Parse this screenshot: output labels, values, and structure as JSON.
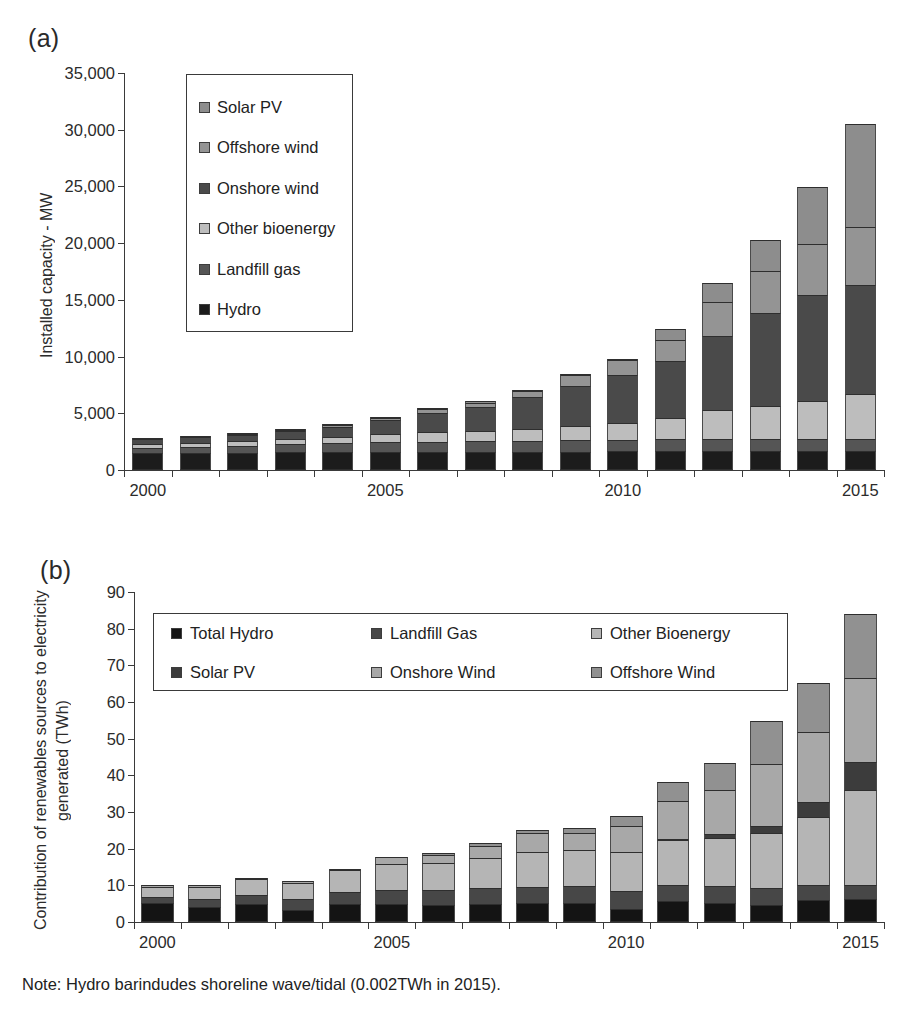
{
  "figure": {
    "note": "Note: Hydro barindudes shoreline wave/tidal (0.002TWh in 2015)."
  },
  "panel_a": {
    "label": "(a)",
    "legend_items": [
      {
        "label": "Solar PV",
        "color": "#8d8d8d"
      },
      {
        "label": "Offshore wind",
        "color": "#949494"
      },
      {
        "label": "Onshore wind",
        "color": "#4a4a4a"
      },
      {
        "label": "Other bioenergy",
        "color": "#bdbdbd"
      },
      {
        "label": "Landfill gas",
        "color": "#555555"
      },
      {
        "label": "Hydro",
        "color": "#1c1c1c"
      }
    ]
  },
  "panel_b": {
    "label": "(b)",
    "legend_items": [
      {
        "label": "Total Hydro",
        "color": "#141414"
      },
      {
        "label": "Landfill Gas",
        "color": "#474747"
      },
      {
        "label": "Other Bioenergy",
        "color": "#b5b5b5"
      },
      {
        "label": "Solar PV",
        "color": "#3c3c3c"
      },
      {
        "label": "Onshore Wind",
        "color": "#a8a8a8"
      },
      {
        "label": "Offshore Wind",
        "color": "#919191"
      }
    ]
  },
  "chart_data": [
    {
      "id": "chart-a",
      "type": "bar",
      "stacked": true,
      "title": "",
      "panel": "(a)",
      "xlabel": "",
      "ylabel": "Installed capacity - MW",
      "ylim": [
        0,
        35000
      ],
      "yticks": [
        "0",
        "5,000",
        "10,000",
        "15,000",
        "20,000",
        "25,000",
        "30,000",
        "35,000"
      ],
      "ytick_values": [
        0,
        5000,
        10000,
        15000,
        20000,
        25000,
        30000,
        35000
      ],
      "grid": false,
      "legend_position": "upper-left-inside",
      "categories": [
        2000,
        2001,
        2002,
        2003,
        2004,
        2005,
        2006,
        2007,
        2008,
        2009,
        2010,
        2011,
        2012,
        2013,
        2014,
        2015
      ],
      "xtick_labels": [
        "2000",
        "2005",
        "2010",
        "2015"
      ],
      "xtick_label_categories": [
        2000,
        2005,
        2010,
        2015
      ],
      "series": [
        {
          "name": "Hydro",
          "color": "#1c1c1c",
          "values": [
            1520,
            1530,
            1540,
            1550,
            1560,
            1570,
            1580,
            1590,
            1600,
            1620,
            1640,
            1650,
            1660,
            1680,
            1690,
            1700
          ]
        },
        {
          "name": "Landfill gas",
          "color": "#555555",
          "values": [
            450,
            530,
            610,
            700,
            790,
            870,
            930,
            960,
            1000,
            1020,
            1040,
            1050,
            1060,
            1060,
            1060,
            1060
          ]
        },
        {
          "name": "Other bioenergy",
          "color": "#bdbdbd",
          "values": [
            330,
            360,
            400,
            470,
            560,
            700,
            830,
            900,
            1000,
            1200,
            1500,
            1900,
            2600,
            2900,
            3300,
            3960
          ]
        },
        {
          "name": "Onshore wind",
          "color": "#4a4a4a",
          "values": [
            410,
            490,
            560,
            740,
            900,
            1250,
            1700,
            2100,
            2800,
            3600,
            4200,
            5000,
            6500,
            8200,
            9400,
            9600
          ]
        },
        {
          "name": "Offshore wind",
          "color": "#949494",
          "values": [
            4,
            4,
            60,
            60,
            124,
            214,
            304,
            394,
            590,
            950,
            1340,
            1840,
            2990,
            3700,
            4500,
            5100
          ]
        },
        {
          "name": "Solar PV",
          "color": "#8d8d8d",
          "values": [
            2,
            3,
            4,
            6,
            8,
            11,
            14,
            18,
            23,
            30,
            100,
            950,
            1680,
            2740,
            5000,
            9100
          ]
        }
      ]
    },
    {
      "id": "chart-b",
      "type": "bar",
      "stacked": true,
      "title": "",
      "panel": "(b)",
      "xlabel": "",
      "ylabel": "Contribution of renewables sources to electricity generated (TWh)",
      "ylim": [
        0,
        90
      ],
      "yticks": [
        "0",
        "10",
        "20",
        "30",
        "40",
        "50",
        "60",
        "70",
        "80",
        "90"
      ],
      "ytick_values": [
        0,
        10,
        20,
        30,
        40,
        50,
        60,
        70,
        80,
        90
      ],
      "grid": false,
      "legend_position": "upper-center-inside",
      "categories": [
        2000,
        2001,
        2002,
        2003,
        2004,
        2005,
        2006,
        2007,
        2008,
        2009,
        2010,
        2011,
        2012,
        2013,
        2014,
        2015
      ],
      "xtick_labels": [
        "2000",
        "2005",
        "2010",
        "2015"
      ],
      "xtick_label_categories": [
        2000,
        2005,
        2010,
        2015
      ],
      "series": [
        {
          "name": "Total Hydro",
          "color": "#141414",
          "values": [
            5.1,
            4.1,
            4.8,
            3.2,
            4.8,
            4.9,
            4.6,
            5.0,
            5.1,
            5.3,
            3.6,
            5.7,
            5.3,
            4.7,
            5.9,
            6.3
          ]
        },
        {
          "name": "Landfill Gas",
          "color": "#474747",
          "values": [
            1.7,
            2.2,
            2.6,
            3.0,
            3.4,
            3.9,
            4.2,
            4.4,
            4.5,
            4.6,
            4.8,
            4.3,
            4.5,
            4.5,
            4.1,
            3.9
          ]
        },
        {
          "name": "Other Bioenergy",
          "color": "#b5b5b5",
          "values": [
            2.7,
            3.2,
            4.2,
            4.4,
            5.9,
            7.0,
            7.4,
            8.0,
            9.5,
            9.7,
            10.6,
            12.4,
            13.0,
            15.0,
            18.6,
            25.8
          ]
        },
        {
          "name": "Solar PV",
          "color": "#3c3c3c",
          "values": [
            0.0,
            0.0,
            0.0,
            0.0,
            0.0,
            0.0,
            0.0,
            0.0,
            0.0,
            0.0,
            0.0,
            0.2,
            1.2,
            2.0,
            4.1,
            7.6
          ]
        },
        {
          "name": "Onshore Wind",
          "color": "#a8a8a8",
          "values": [
            0.7,
            0.6,
            0.4,
            0.5,
            0.2,
            1.8,
            2.2,
            3.4,
            5.1,
            4.8,
            7.1,
            10.5,
            12.0,
            17.0,
            19.0,
            22.9
          ]
        },
        {
          "name": "Offshore Wind",
          "color": "#919191",
          "values": [
            0.0,
            0.0,
            0.0,
            0.0,
            0.0,
            0.0,
            0.4,
            0.7,
            0.8,
            1.3,
            2.9,
            5.1,
            7.5,
            11.5,
            13.4,
            17.4
          ]
        }
      ]
    }
  ]
}
